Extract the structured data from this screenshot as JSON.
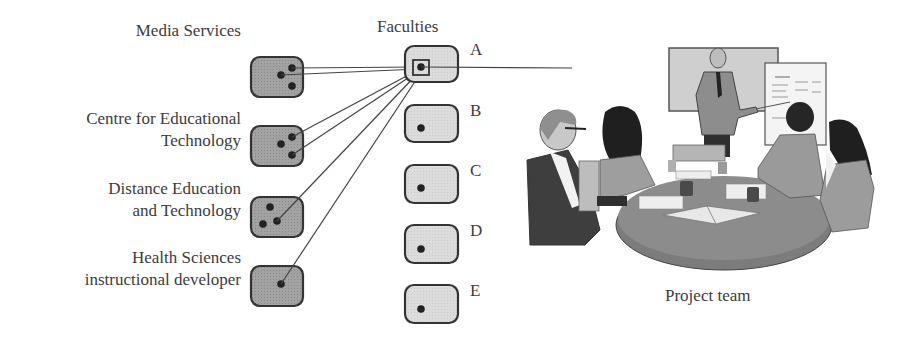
{
  "diagram": {
    "faculties_title": "Faculties",
    "caption": "Project team",
    "colors": {
      "unit_fill": "#9a9a9a",
      "faculty_fill": "#d6d6d6",
      "stroke": "#333333",
      "dot": "#222222",
      "line": "#444444"
    },
    "units": [
      {
        "label_lines": [
          "Media Services"
        ],
        "label_x": 241,
        "label_y": 20,
        "box": {
          "x": 251,
          "y": 57,
          "w": 52,
          "h": 40
        },
        "dots": [
          [
            292,
            68
          ],
          [
            281,
            75
          ],
          [
            292,
            86
          ]
        ]
      },
      {
        "label_lines": [
          "Centre for Educational",
          "Technology"
        ],
        "label_x": 241,
        "label_y": 108,
        "box": {
          "x": 251,
          "y": 126,
          "w": 52,
          "h": 40
        },
        "dots": [
          [
            292,
            137
          ],
          [
            281,
            144
          ],
          [
            292,
            155
          ]
        ]
      },
      {
        "label_lines": [
          "Distance Education",
          "and Technology"
        ],
        "label_x": 241,
        "label_y": 178,
        "box": {
          "x": 251,
          "y": 197,
          "w": 52,
          "h": 40
        },
        "dots": [
          [
            270,
            207
          ],
          [
            263,
            224
          ],
          [
            277,
            221
          ]
        ]
      },
      {
        "label_lines": [
          "Health Sciences",
          "instructional developer"
        ],
        "label_x": 241,
        "label_y": 247,
        "box": {
          "x": 251,
          "y": 266,
          "w": 52,
          "h": 40
        },
        "dots": [
          [
            281,
            284
          ]
        ]
      }
    ],
    "faculties": [
      {
        "letter": "A",
        "box": {
          "x": 405,
          "y": 46,
          "w": 53,
          "h": 36
        },
        "dot": [
          421,
          67
        ],
        "highlight": true,
        "letter_x": 470,
        "letter_y": 40
      },
      {
        "letter": "B",
        "box": {
          "x": 405,
          "y": 105,
          "w": 53,
          "h": 37
        },
        "dot": [
          421,
          128
        ],
        "highlight": false,
        "letter_x": 470,
        "letter_y": 101
      },
      {
        "letter": "C",
        "box": {
          "x": 405,
          "y": 165,
          "w": 53,
          "h": 38
        },
        "dot": [
          421,
          188
        ],
        "highlight": false,
        "letter_x": 470,
        "letter_y": 161
      },
      {
        "letter": "D",
        "box": {
          "x": 405,
          "y": 225,
          "w": 53,
          "h": 38
        },
        "dot": [
          421,
          249
        ],
        "highlight": false,
        "letter_x": 470,
        "letter_y": 221
      },
      {
        "letter": "E",
        "box": {
          "x": 405,
          "y": 285,
          "w": 53,
          "h": 38
        },
        "dot": [
          421,
          309
        ],
        "highlight": false,
        "letter_x": 470,
        "letter_y": 281
      }
    ],
    "connections": [
      {
        "from": [
          292,
          68
        ],
        "to": [
          419,
          67
        ]
      },
      {
        "from": [
          281,
          75
        ],
        "to": [
          419,
          69
        ]
      },
      {
        "from": [
          292,
          137
        ],
        "to": [
          416,
          71
        ]
      },
      {
        "from": [
          292,
          155
        ],
        "to": [
          417,
          72
        ]
      },
      {
        "from": [
          277,
          221
        ],
        "to": [
          418,
          73
        ]
      },
      {
        "from": [
          281,
          284
        ],
        "to": [
          420,
          74
        ]
      },
      {
        "from": [
          421,
          67
        ],
        "to": [
          572,
          68
        ]
      }
    ]
  }
}
